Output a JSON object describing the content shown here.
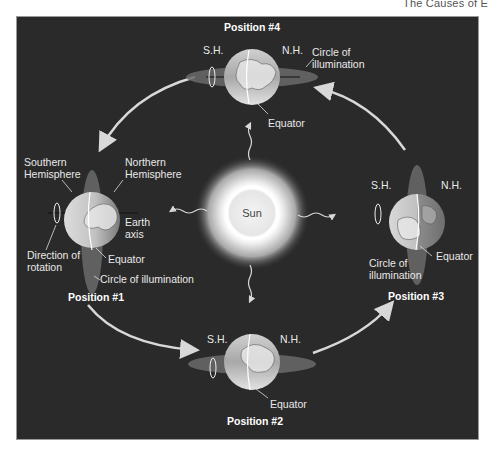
{
  "header": {
    "title": "The Causes of E"
  },
  "diagram": {
    "sun": {
      "label": "Sun"
    },
    "positions": [
      {
        "id": "position-1",
        "title": "Position #1",
        "labels": {
          "southern": "Southern",
          "southern2": "Hemisphere",
          "northern": "Northern",
          "northern2": "Hemisphere",
          "axis": "Earth",
          "axis2": "axis",
          "rotation": "Direction of",
          "rotation2": "rotation",
          "equator": "Equator",
          "circle": "Circle of illumination"
        }
      },
      {
        "id": "position-2",
        "title": "Position #2",
        "labels": {
          "sh": "S.H.",
          "nh": "N.H.",
          "equator": "Equator"
        }
      },
      {
        "id": "position-3",
        "title": "Position #3",
        "labels": {
          "sh": "S.H.",
          "nh": "N.H.",
          "equator": "Equator",
          "circle": "Circle of",
          "circle2": "illumination"
        }
      },
      {
        "id": "position-4",
        "title": "Position #4",
        "labels": {
          "sh": "S.H.",
          "nh": "N.H.",
          "equator": "Equator",
          "circle": "Circle of",
          "circle2": "illumination"
        }
      }
    ]
  }
}
